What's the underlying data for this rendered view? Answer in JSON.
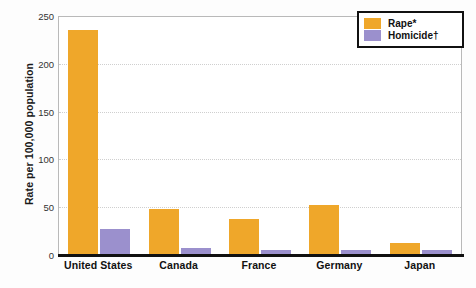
{
  "scan_artifact_text": "",
  "chart_data": {
    "type": "bar",
    "title": "",
    "xlabel": "",
    "ylabel": "Rate per 100,000 population",
    "ylim": [
      0,
      250
    ],
    "yticks": [
      0,
      50,
      100,
      150,
      200,
      250
    ],
    "ytick_labels": [
      "0",
      "50",
      "100",
      "150",
      "200",
      "250"
    ],
    "grid": "horizontal-dotted",
    "legend_position": "top-right",
    "categories": [
      "United States",
      "Canada",
      "France",
      "Germany",
      "Japan"
    ],
    "series": [
      {
        "name": "Rape*",
        "color": "#efa72a",
        "values": [
          236,
          47,
          37,
          52,
          12
        ]
      },
      {
        "name": "Homicide†",
        "color": "#9b90cd",
        "values": [
          26,
          6,
          4,
          4,
          4
        ]
      }
    ]
  },
  "legend": {
    "items": [
      {
        "label": "Rape*",
        "color": "#efa72a"
      },
      {
        "label": "Homicide†",
        "color": "#9b90cd"
      }
    ]
  },
  "axes": {
    "y_title": "Rate per 100,000 population",
    "y_tick_labels": [
      "250",
      "200",
      "150",
      "100",
      "50",
      "0"
    ],
    "x_tick_labels": [
      "United States",
      "Canada",
      "France",
      "Germany",
      "Japan"
    ]
  }
}
